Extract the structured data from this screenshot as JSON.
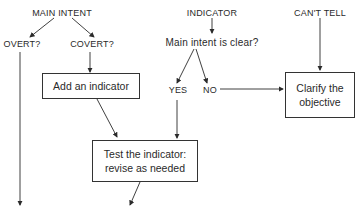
{
  "diagram": {
    "type": "flowchart",
    "nodes": {
      "main_intent": "MAIN INTENT",
      "overt": "OVERT?",
      "covert": "COVERT?",
      "indicator": "INDICATOR",
      "main_intent_clear": "Main intent is clear?",
      "yes": "YES",
      "no": "NO",
      "cant_tell": "CAN'T TELL",
      "add_indicator": "Add an indicator",
      "clarify_line1": "Clarify the",
      "clarify_line2": "objective",
      "test_line1": "Test the indicator:",
      "test_line2": "revise as needed"
    },
    "edges": [
      {
        "from": "MAIN INTENT",
        "to": "OVERT?"
      },
      {
        "from": "MAIN INTENT",
        "to": "COVERT?"
      },
      {
        "from": "COVERT?",
        "to": "Add an indicator"
      },
      {
        "from": "INDICATOR",
        "to": "Main intent is clear?"
      },
      {
        "from": "Main intent is clear?",
        "to": "YES"
      },
      {
        "from": "Main intent is clear?",
        "to": "NO"
      },
      {
        "from": "NO",
        "to": "Clarify the objective"
      },
      {
        "from": "CAN'T TELL",
        "to": "Clarify the objective"
      },
      {
        "from": "Add an indicator",
        "to": "Test the indicator: revise as needed"
      },
      {
        "from": "YES",
        "to": "Test the indicator: revise as needed"
      },
      {
        "from": "OVERT?",
        "to": "(continues below)"
      },
      {
        "from": "Test the indicator: revise as needed",
        "to": "(continues below)"
      }
    ],
    "colors": {
      "ink": "#2a2a2a",
      "background": "#ffffff"
    }
  }
}
